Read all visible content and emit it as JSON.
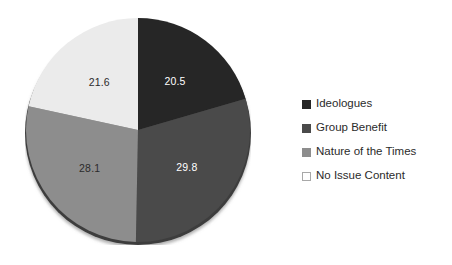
{
  "chart_data": {
    "type": "pie",
    "title": "",
    "subtitle": "",
    "xlabel": "",
    "ylabel": "",
    "grid": false,
    "legend_position": "right",
    "start_angle_oclock": 12,
    "direction": "clockwise",
    "categories": [
      "Ideologues",
      "Group Benefit",
      "Nature of the Times",
      "No Issue Content"
    ],
    "values": [
      20.5,
      29.8,
      28.1,
      21.6
    ],
    "data_labels": [
      "20.5",
      "29.8",
      "28.1",
      "21.6"
    ],
    "slice_colors": [
      "#262626",
      "#4a4a4a",
      "#8d8d8d",
      "#ebebeb"
    ],
    "data_label_colors": [
      "#ffffff",
      "#ffffff",
      "#2b2b2b",
      "#2b2b2b"
    ],
    "total": 100.0
  },
  "pie": {
    "slices": [
      {
        "name": "Ideologues",
        "label": "20.5",
        "value": 20.5,
        "color": "#262626",
        "label_color": "#ffffff",
        "label_x": 167,
        "label_y": 71
      },
      {
        "name": "Group Benefit",
        "label": "29.8",
        "value": 29.8,
        "color": "#4a4a4a",
        "label_color": "#ffffff",
        "label_x": 175,
        "label_y": 174
      },
      {
        "name": "Nature of the Times",
        "label": "28.1",
        "value": 28.1,
        "color": "#8d8d8d",
        "label_color": "#2b2b2b",
        "label_x": 96,
        "label_y": 177
      },
      {
        "name": "No Issue Content",
        "label": "21.6",
        "value": 21.6,
        "color": "#ebebeb",
        "label_color": "#2b2b2b",
        "label_x": 89,
        "label_y": 72
      }
    ],
    "edge_color": "#3d3d3d"
  },
  "legend": {
    "items": [
      {
        "label": "Ideologues",
        "swatch": "#262626",
        "border": "#262626"
      },
      {
        "label": "Group Benefit",
        "swatch": "#4a4a4a",
        "border": "#4a4a4a"
      },
      {
        "label": "Nature of the Times",
        "swatch": "#8d8d8d",
        "border": "#8d8d8d"
      },
      {
        "label": "No Issue Content",
        "swatch": "#ffffff",
        "border": "#a8a8a8"
      }
    ]
  }
}
